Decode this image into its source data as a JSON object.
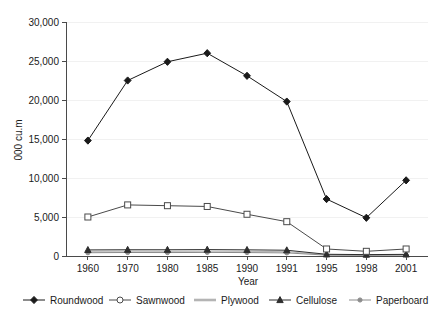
{
  "chart_data": {
    "type": "line",
    "title": "",
    "xlabel": "Year",
    "ylabel": "000 cu.m",
    "categories": [
      "1960",
      "1970",
      "1980",
      "1985",
      "1990",
      "1991",
      "1995",
      "1998",
      "2001"
    ],
    "ylim": [
      0,
      30000
    ],
    "yticks": [
      0,
      5000,
      10000,
      15000,
      20000,
      25000,
      30000
    ],
    "ytick_labels": [
      "0",
      "5,000",
      "10,000",
      "15,000",
      "20,000",
      "25,000",
      "30,000"
    ],
    "grid": true,
    "legend_position": "bottom",
    "series": [
      {
        "name": "Roundwood",
        "color": "#1a1a1a",
        "marker": "diamond",
        "values": [
          14800,
          22500,
          24900,
          26000,
          23100,
          19800,
          7300,
          4900,
          9700
        ]
      },
      {
        "name": "Sawnwood",
        "color": "#4a4a4a",
        "marker": "open-square",
        "values": [
          5000,
          6550,
          6450,
          6350,
          5350,
          4400,
          900,
          600,
          900
        ]
      },
      {
        "name": "Plywood",
        "color": "#b4b4b4",
        "marker": "none",
        "values": [
          600,
          620,
          600,
          620,
          600,
          560,
          150,
          120,
          160
        ]
      },
      {
        "name": "Cellulose",
        "color": "#2e2e2e",
        "marker": "triangle",
        "values": [
          780,
          800,
          800,
          820,
          790,
          740,
          220,
          180,
          210
        ]
      },
      {
        "name": "Paperboard",
        "color": "#8c8c8c",
        "marker": "small-dot",
        "values": [
          420,
          450,
          440,
          460,
          440,
          400,
          110,
          90,
          120
        ]
      }
    ]
  },
  "legend": {
    "items": [
      {
        "label": "Roundwood"
      },
      {
        "label": "Sawnwood"
      },
      {
        "label": "Plywood"
      },
      {
        "label": "Cellulose"
      },
      {
        "label": "Paperboard"
      }
    ]
  }
}
